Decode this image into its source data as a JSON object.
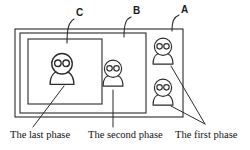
{
  "figure": {
    "stroke_color": "#2b2b2b",
    "background_color": "#ffffff",
    "width": 250,
    "height": 150
  },
  "region_labels": [
    {
      "id": "label-c",
      "text": "C",
      "x": 76,
      "y": 16
    },
    {
      "id": "label-b",
      "text": "B",
      "x": 133,
      "y": 14
    },
    {
      "id": "label-a",
      "text": "A",
      "x": 181,
      "y": 13
    }
  ],
  "frames": [
    {
      "id": "frame-a",
      "label": "A",
      "x": 15,
      "y": 29,
      "width": 168,
      "height": 88
    },
    {
      "id": "frame-b",
      "label": "B",
      "x": 20,
      "y": 33,
      "width": 126,
      "height": 80
    },
    {
      "id": "frame-c",
      "label": "C",
      "x": 28,
      "y": 39,
      "width": 74,
      "height": 65
    }
  ],
  "persons": [
    {
      "id": "person-last-phase",
      "phase": "last",
      "cx": 62,
      "cy": 70,
      "scale": 1.25
    },
    {
      "id": "person-second-phase",
      "phase": "second",
      "cx": 113,
      "cy": 74,
      "scale": 1.05
    },
    {
      "id": "person-first-phase-top",
      "phase": "first",
      "cx": 163,
      "cy": 52,
      "scale": 1.05
    },
    {
      "id": "person-first-phase-bottom",
      "phase": "first",
      "cx": 163,
      "cy": 93,
      "scale": 1.05
    }
  ],
  "captions": [
    {
      "id": "caption-last-phase",
      "text": "The last phase",
      "x": 10,
      "y": 138
    },
    {
      "id": "caption-second-phase",
      "text": "The second phase",
      "x": 88,
      "y": 138
    },
    {
      "id": "caption-first-phase",
      "text": "The first phase",
      "x": 175,
      "y": 138
    }
  ],
  "pointers": [
    {
      "id": "pointer-last-phase",
      "from_x": 33,
      "from_y": 127,
      "to_x": 64,
      "to_y": 86
    },
    {
      "id": "pointer-second-phase",
      "from_x": 113,
      "from_y": 127,
      "to_x": 113,
      "to_y": 90
    },
    {
      "id": "pointer-first-phase-top",
      "from_x": 205,
      "from_y": 124,
      "to_x": 171,
      "to_y": 66
    },
    {
      "id": "pointer-first-phase-bottom",
      "from_x": 205,
      "from_y": 124,
      "to_x": 171,
      "to_y": 106
    }
  ]
}
